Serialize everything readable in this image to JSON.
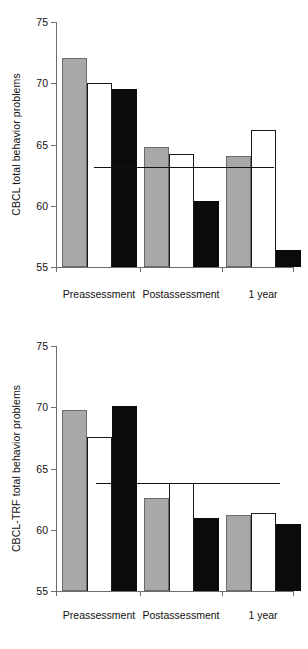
{
  "chart_data": [
    {
      "type": "bar",
      "title": "",
      "xlabel": "",
      "ylabel": "CBCL total behavior problems",
      "categories": [
        "Preassessment",
        "Postassessment",
        "1 year"
      ],
      "ylim": [
        55,
        75
      ],
      "yticks": [
        55,
        60,
        65,
        70,
        75
      ],
      "ytick_labels": [
        "55",
        "60",
        "65",
        "70",
        "75"
      ],
      "grid": false,
      "legend": "none",
      "series": [
        {
          "name": "gray",
          "fill": "#a8a8a8",
          "values": [
            72.1,
            64.8,
            64.1
          ]
        },
        {
          "name": "white",
          "fill": "#ffffff",
          "values": [
            70.0,
            64.2,
            66.2
          ]
        },
        {
          "name": "black",
          "fill": "#0b0b0b",
          "values": [
            69.5,
            60.4,
            56.4
          ]
        }
      ],
      "annotations": [
        {
          "kind": "hline",
          "label": "normative reference line",
          "value": 63.2,
          "color": "#111111"
        }
      ]
    },
    {
      "type": "bar",
      "title": "",
      "xlabel": "",
      "ylabel": "CBCL-TRF total behavior problems",
      "categories": [
        "Preassessment",
        "Postassessment",
        "1 year"
      ],
      "ylim": [
        55,
        75
      ],
      "yticks": [
        55,
        60,
        65,
        70,
        75
      ],
      "ytick_labels": [
        "55",
        "60",
        "65",
        "70",
        "75"
      ],
      "grid": false,
      "legend": "none",
      "series": [
        {
          "name": "gray",
          "fill": "#a8a8a8",
          "values": [
            69.8,
            62.6,
            61.2
          ]
        },
        {
          "name": "white",
          "fill": "#ffffff",
          "values": [
            67.6,
            63.8,
            61.4
          ]
        },
        {
          "name": "black",
          "fill": "#0b0b0b",
          "values": [
            70.1,
            61.0,
            60.5
          ]
        }
      ],
      "annotations": [
        {
          "kind": "hline",
          "label": "normative reference line",
          "value": 63.8,
          "color": "#111111"
        }
      ]
    }
  ]
}
